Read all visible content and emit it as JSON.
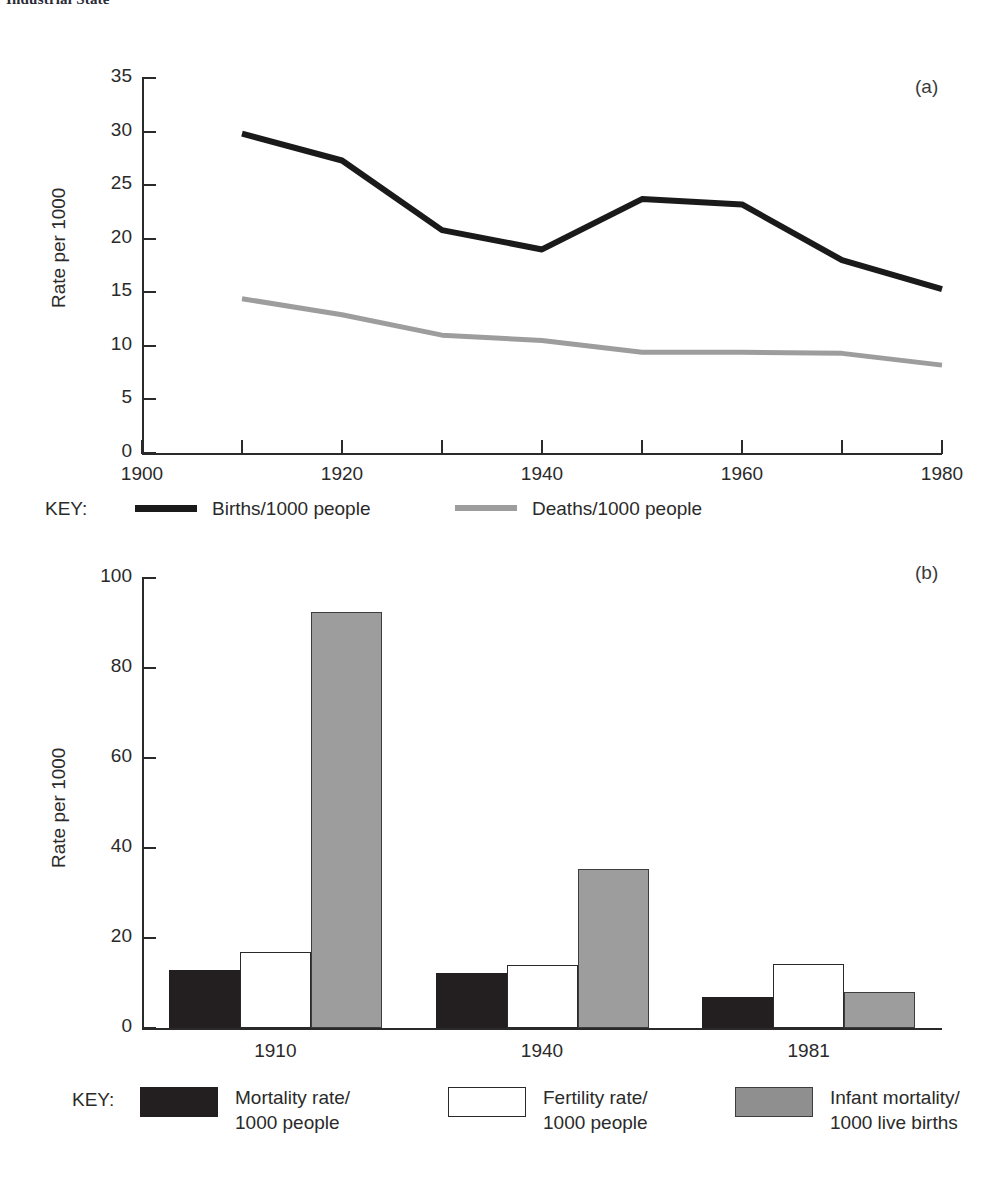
{
  "running_head": "Industrial State",
  "panel_a": {
    "tag": "(a)",
    "ylabel": "Rate per 1000",
    "yticks": [
      "0",
      "5",
      "10",
      "15",
      "20",
      "25",
      "30",
      "35"
    ],
    "xticks_labeled": [
      "1900",
      "1920",
      "1940",
      "1960",
      "1980"
    ],
    "key_word": "KEY:",
    "legend": [
      {
        "label": "Births/1000 people",
        "color": "#1a1a1a",
        "style": "line-black"
      },
      {
        "label": "Deaths/1000 people",
        "color": "#9d9d9d",
        "style": "line-grey"
      }
    ]
  },
  "panel_b": {
    "tag": "(b)",
    "ylabel": "Rate per 1000",
    "yticks": [
      "0",
      "20",
      "40",
      "60",
      "80",
      "100"
    ],
    "xticks": [
      "1910",
      "1940",
      "1981"
    ],
    "key_word": "KEY:",
    "legend": [
      {
        "label_line1": "Mortality rate/",
        "label_line2": "1000 people",
        "color": "#231f20",
        "style": "box-black"
      },
      {
        "label_line1": "Fertility rate/",
        "label_line2": "1000 people",
        "color": "#ffffff",
        "style": "box-white"
      },
      {
        "label_line1": "Infant mortality/",
        "label_line2": "1000 live births",
        "color": "#8f8f8f",
        "style": "box-grey"
      }
    ]
  },
  "chart_data": [
    {
      "type": "line",
      "panel": "(a)",
      "title": "",
      "xlabel": "",
      "ylabel": "Rate per 1000",
      "xlim": [
        1900,
        1980
      ],
      "ylim": [
        0,
        35
      ],
      "xtick_step_minor": 10,
      "xtick_step_major": 20,
      "ytick_step": 5,
      "grid": false,
      "legend_position": "below-left",
      "x": [
        1910,
        1920,
        1930,
        1940,
        1950,
        1960,
        1970,
        1980
      ],
      "series": [
        {
          "name": "Births/1000 people",
          "color": "#1a1a1a",
          "values": [
            29.8,
            27.3,
            20.8,
            19.0,
            23.7,
            23.2,
            18.0,
            15.3
          ]
        },
        {
          "name": "Deaths/1000 people",
          "color": "#9d9d9d",
          "values": [
            14.4,
            12.9,
            11.0,
            10.5,
            9.4,
            9.4,
            9.3,
            8.2
          ]
        }
      ]
    },
    {
      "type": "bar",
      "panel": "(b)",
      "title": "",
      "xlabel": "",
      "ylabel": "Rate per 1000",
      "ylim": [
        0,
        100
      ],
      "ytick_step": 20,
      "grid": false,
      "legend_position": "below",
      "categories": [
        "1910",
        "1940",
        "1981"
      ],
      "series": [
        {
          "name": "Mortality rate/1000 people",
          "color": "#231f20",
          "values": [
            13.0,
            12.2,
            7.0
          ]
        },
        {
          "name": "Fertility rate/1000 people",
          "color": "#ffffff",
          "values": [
            17.0,
            14.0,
            14.2
          ]
        },
        {
          "name": "Infant mortality/1000 live births",
          "color": "#8f8f8f",
          "values": [
            92.5,
            35.3,
            8.0
          ]
        }
      ]
    }
  ]
}
